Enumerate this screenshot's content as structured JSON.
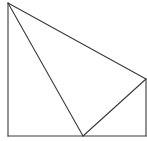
{
  "diagram": {
    "type": "geometry-figure",
    "background": "#ffffff",
    "stroke_color": "#3a3a3a",
    "points": {
      "top_left": [
        8,
        3
      ],
      "bottom_left": [
        8,
        136
      ],
      "bottom_mid": [
        83,
        136
      ],
      "bottom_right": [
        146,
        136
      ],
      "right": [
        146,
        79
      ]
    },
    "segments": [
      {
        "name": "left-side",
        "from": "top_left",
        "to": "bottom_left"
      },
      {
        "name": "bottom-side",
        "from": "bottom_left",
        "to": "bottom_right"
      },
      {
        "name": "right-side",
        "from": "bottom_right",
        "to": "right"
      },
      {
        "name": "top-diagonal",
        "from": "top_left",
        "to": "right"
      },
      {
        "name": "inner-diagonal-left",
        "from": "top_left",
        "to": "bottom_mid"
      },
      {
        "name": "inner-diagonal-right",
        "from": "bottom_mid",
        "to": "right"
      }
    ]
  }
}
